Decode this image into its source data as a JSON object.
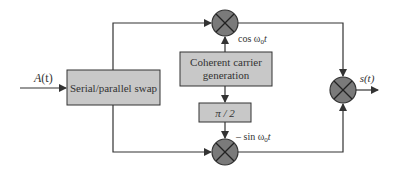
{
  "diagram": {
    "input_label": "A(t)",
    "output_label": "s(t)",
    "blocks": {
      "serial_parallel": "Serial/parallel swap",
      "carrier_line1": "Coherent carrier",
      "carrier_line2": "generation",
      "phase_shift": "π / 2"
    },
    "carrier_labels": {
      "cos": "cos ω",
      "cos_sub": "0",
      "cos_t": "t",
      "sin": "– sin ω",
      "sin_sub": "0",
      "sin_t": "t"
    },
    "colors": {
      "block_fill": "#c8c8c8",
      "multiplier_fill": "#7a7a7a",
      "line": "#333333"
    }
  }
}
